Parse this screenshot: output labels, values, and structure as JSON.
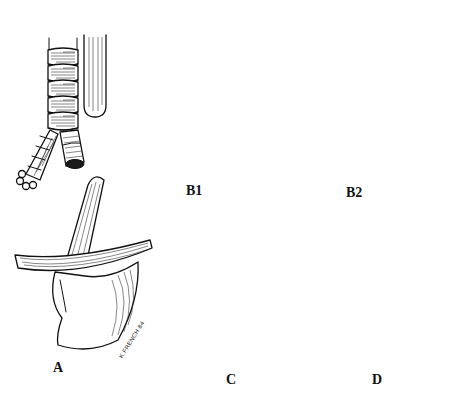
{
  "figure": {
    "background": "#ffffff",
    "ink_color": "#111111",
    "panels": [
      {
        "id": "A",
        "label": "A",
        "description": "Proximal esophageal pouch and distal esophagus ending blindly above diaphragm/stomach, no fistula"
      },
      {
        "id": "B1",
        "label": "B1",
        "description": "Proximal blind pouch with distal tracheoesophageal fistula"
      },
      {
        "id": "B2",
        "label": "B2",
        "description": "Proximal and distal esophagus connected to trachea near carina"
      },
      {
        "id": "C",
        "label": "C",
        "description": "Proximal esophagus with fistula to trachea, distal esophagus blind"
      },
      {
        "id": "D",
        "label": "D",
        "description": "Continuous esophagus with H-type tracheoesophageal fistula"
      }
    ],
    "signature": "K.FRENCH 84"
  }
}
